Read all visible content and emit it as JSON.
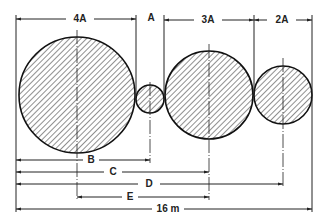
{
  "diagram": {
    "top_dimensions": [
      {
        "id": "dim-4a",
        "label": "4A"
      },
      {
        "id": "dim-a",
        "label": "A"
      },
      {
        "id": "dim-3a",
        "label": "3A"
      },
      {
        "id": "dim-2a",
        "label": "2A"
      }
    ],
    "bottom_dimensions": [
      {
        "id": "dim-b",
        "label": "B"
      },
      {
        "id": "dim-c",
        "label": "C"
      },
      {
        "id": "dim-d",
        "label": "D"
      },
      {
        "id": "dim-e",
        "label": "E"
      },
      {
        "id": "dim-total",
        "label": "16 m"
      }
    ],
    "circles": [
      {
        "id": "circle-large",
        "diameter": "4A"
      },
      {
        "id": "circle-small",
        "diameter": "A"
      },
      {
        "id": "circle-medium",
        "diameter": "3A"
      },
      {
        "id": "circle-right",
        "diameter": "2A"
      }
    ],
    "line_color": "#222222",
    "fill": "diagonal-hatch"
  }
}
